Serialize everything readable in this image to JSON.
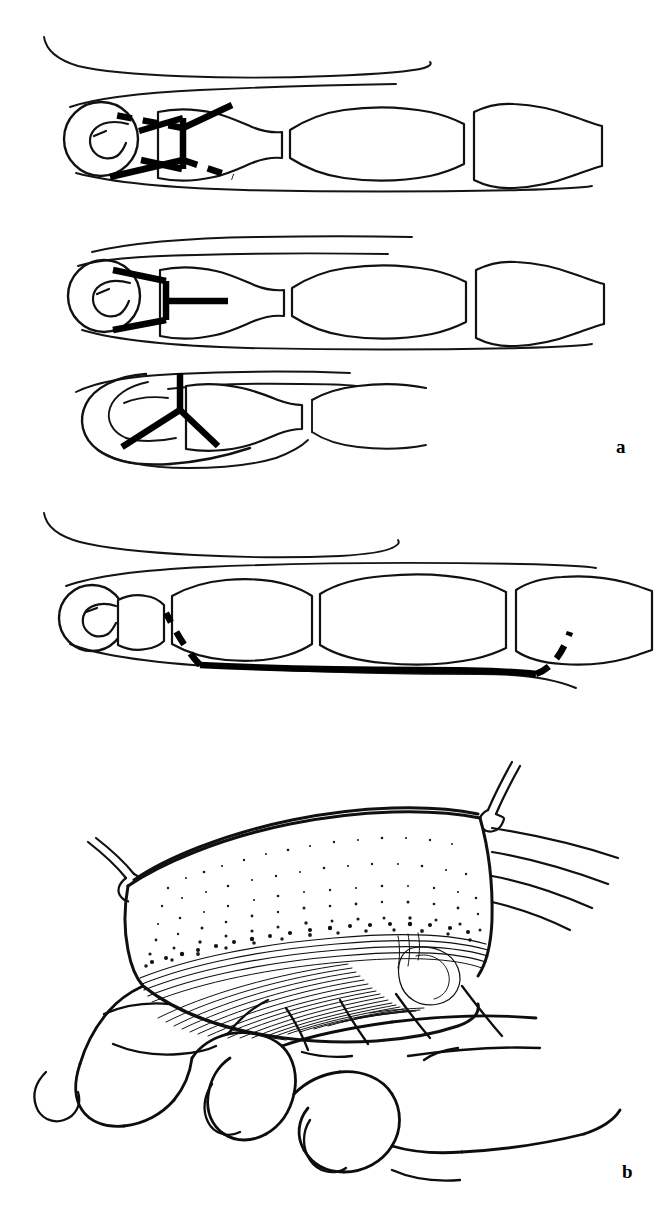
{
  "figure": {
    "background_color": "#ffffff",
    "ink_color": "#111111",
    "width": 660,
    "height": 1210,
    "style": "black-and-white line drawing, medical surgical atlas illustration"
  },
  "panels": [
    {
      "id": "a",
      "label": "a",
      "label_position": {
        "x": 616,
        "y": 437
      },
      "description": "Four schematic finger diagrams showing alternative incision designs over the distal phalanx and finger",
      "diagrams": [
        {
          "id": "diagram-1",
          "order": 1,
          "view": "lateral finger with phalanges",
          "incision_type": "Y-incision with dashed extensions",
          "solid_lines": 2,
          "dashed_lines": 2
        },
        {
          "id": "diagram-2",
          "order": 2,
          "view": "lateral finger with phalanges",
          "incision_type": "V-chevron with central horizontal limb",
          "solid_lines": 3,
          "dashed_lines": 0
        },
        {
          "id": "diagram-3",
          "order": 3,
          "view": "volar pulp of fingertip",
          "incision_type": "inverted Y (trident) incision",
          "solid_lines": 3,
          "dashed_lines": 0
        },
        {
          "id": "diagram-4",
          "order": 4,
          "view": "lateral finger with phalanges",
          "incision_type": "mid-lateral longitudinal incision with oblique dashed extensions at both ends",
          "solid_lines": 1,
          "dashed_lines": 2
        }
      ]
    },
    {
      "id": "b",
      "label": "b",
      "label_position": {
        "x": 622,
        "y": 1162
      },
      "description": "Elevated skin flap over a flexed hand, retracted by two suture loops, exposing underlying fibrous tissue and tendon",
      "elements": [
        {
          "name": "skin-flap",
          "shading": "stipple"
        },
        {
          "name": "suture-left",
          "count": 1
        },
        {
          "name": "suture-right",
          "count": 1
        },
        {
          "name": "exposed-fascia",
          "shading": "fine parallel hatching"
        },
        {
          "name": "hand",
          "posture": "flexed fingers, palm view"
        }
      ]
    }
  ]
}
